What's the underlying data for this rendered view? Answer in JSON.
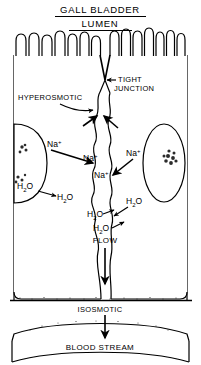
{
  "figure": {
    "title_line1": "GALL  BLADDER",
    "title_line2": "LUMEN",
    "type": "biological-diagram"
  },
  "labels": {
    "tight_junction": "TIGHT\nJUNCTION",
    "tight_junction_l1": "TIGHT",
    "tight_junction_l2": "JUNCTION",
    "hyperosmotic": "HYPEROSMOTIC",
    "flow": "FLOW",
    "isosmotic": "ISOSMOTIC",
    "blood_stream": "BLOOD  STREAM"
  },
  "ions": {
    "sodium": "Na",
    "sodium_charge": "+",
    "water_h": "H",
    "water_two": "2",
    "water_o": "O"
  },
  "sodium_labels": [
    {
      "id": "na-left",
      "text": "Na",
      "charge": "+",
      "x": 54,
      "y": 148
    },
    {
      "id": "na-center-up",
      "text": "Na",
      "charge": "+",
      "x": 94,
      "y": 157
    },
    {
      "id": "na-right",
      "text": "Na",
      "charge": "+",
      "x": 131,
      "y": 152
    },
    {
      "id": "na-center-down",
      "text": "Na",
      "charge": "+",
      "x": 103,
      "y": 173
    }
  ],
  "water_labels": [
    {
      "id": "h2o-left-outer",
      "x": 22,
      "y": 186
    },
    {
      "id": "h2o-left-inner",
      "x": 62,
      "y": 195
    },
    {
      "id": "h2o-right-outer",
      "x": 131,
      "y": 200
    },
    {
      "id": "h2o-right-inner",
      "x": 95,
      "y": 212
    },
    {
      "id": "h2o-flow-upper",
      "x": 100,
      "y": 219
    }
  ],
  "colors": {
    "ink": "#000000",
    "paper": "#ffffff",
    "stipple": "#2b2b2b"
  },
  "structures": {
    "microvilli_count_left": 8,
    "microvilli_count_right": 10,
    "nucleus_left": "nucleus-left-partial",
    "nucleus_right": "nucleus-right",
    "intercellular_channel": "lateral-intercellular-space",
    "basement_membrane": "basement-membrane",
    "capillary": "blood-capillary"
  }
}
